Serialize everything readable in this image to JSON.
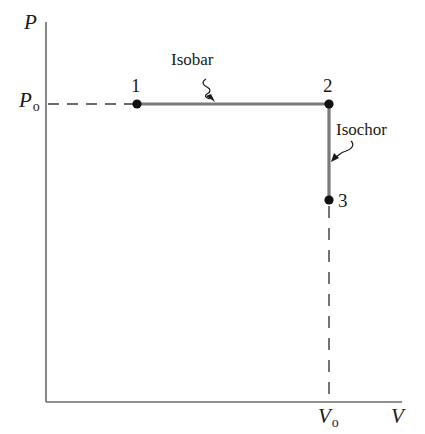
{
  "diagram": {
    "type": "pv-diagram",
    "axes": {
      "y_label": "P",
      "x_label": "V",
      "y_reference": {
        "symbol": "P",
        "subscript": "o"
      },
      "x_reference": {
        "symbol": "V",
        "subscript": "o"
      }
    },
    "points": [
      {
        "id": "1",
        "label": "1",
        "x": 137,
        "y": 104
      },
      {
        "id": "2",
        "label": "2",
        "x": 329,
        "y": 104
      },
      {
        "id": "3",
        "label": "3",
        "x": 329,
        "y": 200
      }
    ],
    "processes": [
      {
        "name": "Isobar",
        "from": "1",
        "to": "2"
      },
      {
        "name": "Isochor",
        "from": "2",
        "to": "3"
      }
    ],
    "colors": {
      "axis": "#6b6b6b",
      "process_line": "#7a7a7a",
      "point": "#111111",
      "dashed_guide": "#3a3a3a",
      "text": "#1a1a1a"
    }
  }
}
